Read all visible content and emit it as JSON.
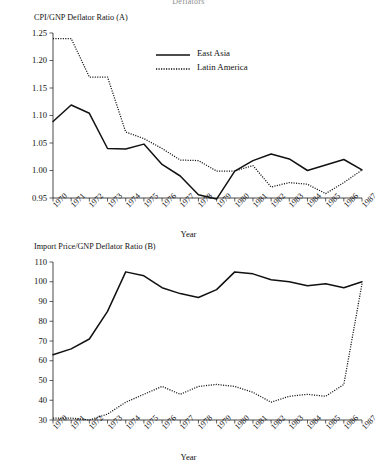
{
  "figure": {
    "caption": "Deflators"
  },
  "panel_a": {
    "title": "CPI/GNP Deflator Ratio (A)",
    "xlabel": "Year",
    "legend": [
      {
        "label": "East Asia",
        "style": "solid"
      },
      {
        "label": "Latin America",
        "style": "dotted"
      }
    ]
  },
  "panel_b": {
    "title": "Import Price/GNP Deflator Ratio (B)",
    "xlabel": "Year"
  },
  "chart_data": [
    {
      "id": "panel_a",
      "type": "line",
      "title": "CPI/GNP Deflator Ratio (A)",
      "xlabel": "Year",
      "ylabel": "",
      "x": [
        1970,
        1971,
        1972,
        1973,
        1974,
        1975,
        1976,
        1977,
        1978,
        1979,
        1980,
        1981,
        1982,
        1983,
        1984,
        1985,
        1986,
        1987
      ],
      "xtick_labels": [
        "1970",
        "1971",
        "1972",
        "1973",
        "1974",
        "1975",
        "1976",
        "1977",
        "1978",
        "1979",
        "1980",
        "1981",
        "1982",
        "1983",
        "1984",
        "1985",
        "1986",
        "1987"
      ],
      "ytick_labels": [
        "0.95",
        "1.00",
        "1.05",
        "1.10",
        "1.15",
        "1.20",
        "1.25"
      ],
      "yticks": [
        0.95,
        1.0,
        1.05,
        1.1,
        1.15,
        1.2,
        1.25
      ],
      "ylim": [
        0.95,
        1.25
      ],
      "xlim": [
        1970,
        1987
      ],
      "grid": false,
      "legend_position": "upper-center",
      "series": [
        {
          "name": "East Asia",
          "style": "solid",
          "values": [
            1.089,
            1.119,
            1.104,
            1.04,
            1.039,
            1.048,
            1.011,
            0.99,
            0.956,
            0.948,
            0.999,
            1.018,
            1.03,
            1.021,
            1.0,
            1.01,
            1.02,
            1.001
          ]
        },
        {
          "name": "Latin America",
          "style": "dotted",
          "values": [
            1.24,
            1.24,
            1.17,
            1.17,
            1.07,
            1.058,
            1.04,
            1.019,
            1.018,
            0.999,
            0.999,
            1.009,
            0.97,
            0.978,
            0.975,
            0.958,
            0.978,
            1.001
          ]
        }
      ]
    },
    {
      "id": "panel_b",
      "type": "line",
      "title": "Import Price/GNP Deflator Ratio (B)",
      "xlabel": "Year",
      "ylabel": "",
      "x": [
        1970,
        1971,
        1972,
        1973,
        1974,
        1975,
        1976,
        1977,
        1978,
        1979,
        1980,
        1981,
        1982,
        1983,
        1984,
        1985,
        1986,
        1987
      ],
      "xtick_labels": [
        "1970",
        "1971",
        "1972",
        "1973",
        "1974",
        "1975",
        "1976",
        "1977",
        "1978",
        "1979",
        "1980",
        "1981",
        "1982",
        "1983",
        "1984",
        "1985",
        "1986",
        "1987"
      ],
      "ytick_labels": [
        "30",
        "40",
        "50",
        "60",
        "70",
        "80",
        "90",
        "100",
        "110"
      ],
      "yticks": [
        30,
        40,
        50,
        60,
        70,
        80,
        90,
        100,
        110
      ],
      "ylim": [
        30,
        110
      ],
      "xlim": [
        1970,
        1987
      ],
      "grid": false,
      "legend_position": "none",
      "series": [
        {
          "name": "East Asia",
          "style": "solid",
          "values": [
            63,
            66,
            71,
            85,
            105,
            103,
            97,
            94,
            92,
            96,
            105,
            104,
            101,
            100,
            98,
            99,
            97,
            100
          ]
        },
        {
          "name": "Latin America",
          "style": "dotted",
          "values": [
            31,
            31,
            30,
            33,
            39,
            43,
            47,
            43,
            47,
            48,
            47,
            44,
            39,
            42,
            43,
            42,
            48,
            99
          ]
        }
      ]
    }
  ]
}
